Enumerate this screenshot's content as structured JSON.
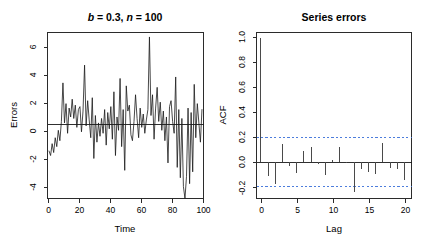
{
  "figure": {
    "width": 423,
    "height": 250,
    "background": "#ffffff",
    "line_color": "#1a1a1a",
    "conf_color": "#3a6fd8"
  },
  "panels": {
    "left": {
      "title_full": "b = 0.3, n = 100",
      "title_parts": {
        "b_sym": "b",
        "b_eq": " = 0.3, ",
        "n_sym": "n",
        "n_eq": " = 100"
      },
      "xlabel": "Time",
      "ylabel": "Errors",
      "xticks": [
        "0",
        "20",
        "40",
        "60",
        "80",
        "100"
      ],
      "yticks": [
        "6",
        "4",
        "2",
        "0",
        "-2",
        "-4"
      ]
    },
    "right": {
      "title": "Series errors",
      "xlabel": "Lag",
      "ylabel": "ACF",
      "xticks": [
        "0",
        "5",
        "10",
        "15",
        "20"
      ],
      "yticks": [
        "1.0",
        "0.8",
        "0.6",
        "0.4",
        "0.2",
        "0.0",
        "-0.2"
      ]
    }
  },
  "chart_data": [
    {
      "type": "line",
      "title": "b = 0.3, n = 100",
      "xlabel": "Time",
      "ylabel": "Errors",
      "xlim": [
        0,
        101
      ],
      "ylim": [
        -5.0,
        6.2
      ],
      "xticks": [
        0,
        20,
        40,
        60,
        80,
        100
      ],
      "yticks": [
        6,
        4,
        2,
        0,
        -2,
        -4
      ],
      "grid": false,
      "legend": "none",
      "zero_reference_line": 0,
      "x": [
        1,
        2,
        3,
        4,
        5,
        6,
        7,
        8,
        9,
        10,
        11,
        12,
        13,
        14,
        15,
        16,
        17,
        18,
        19,
        20,
        21,
        22,
        23,
        24,
        25,
        26,
        27,
        28,
        29,
        30,
        31,
        32,
        33,
        34,
        35,
        36,
        37,
        38,
        39,
        40,
        41,
        42,
        43,
        44,
        45,
        46,
        47,
        48,
        49,
        50,
        51,
        52,
        53,
        54,
        55,
        56,
        57,
        58,
        59,
        60,
        61,
        62,
        63,
        64,
        65,
        66,
        67,
        68,
        69,
        70,
        71,
        72,
        73,
        74,
        75,
        76,
        77,
        78,
        79,
        80,
        81,
        82,
        83,
        84,
        85,
        86,
        87,
        88,
        89,
        90,
        91,
        92,
        93,
        94,
        95,
        96,
        97,
        98,
        99,
        100
      ],
      "values": [
        -1.8,
        -2.1,
        -1.3,
        -1.9,
        -0.9,
        -1.5,
        -0.4,
        -1.1,
        0.2,
        2.8,
        0.1,
        1.4,
        -0.6,
        1.1,
        0.5,
        1.7,
        0.4,
        1.3,
        -0.2,
        1.0,
        1.2,
        -0.5,
        0.9,
        4.0,
        -0.1,
        1.6,
        0.3,
        -0.9,
        1.8,
        -2.3,
        0.6,
        -1.2,
        0.1,
        -0.8,
        0.4,
        -0.6,
        1.0,
        -1.4,
        0.8,
        -0.3,
        1.2,
        -1.0,
        2.2,
        -2.1,
        0.5,
        -0.4,
        3.1,
        -1.5,
        1.0,
        -3.1,
        2.6,
        0.9,
        1.3,
        -0.7,
        -1.1,
        0.2,
        2.0,
        0.4,
        -0.9,
        1.1,
        -0.2,
        0.7,
        -0.6,
        0.3,
        1.0,
        5.9,
        0.6,
        2.0,
        -1.0,
        1.1,
        2.5,
        0.2,
        1.5,
        -0.4,
        0.9,
        -1.1,
        0.5,
        -2.6,
        1.2,
        1.6,
        0.2,
        -0.6,
        3.2,
        -2.9,
        1.0,
        -3.6,
        0.4,
        -4.2,
        -5.0,
        -3.5,
        1.1,
        -4.0,
        0.8,
        -3.2,
        2.7,
        -0.9,
        1.4,
        0.1,
        -1.2,
        1.0
      ]
    },
    {
      "type": "bar",
      "title": "Series errors",
      "xlabel": "Lag",
      "ylabel": "ACF",
      "xlim": [
        -0.6,
        21
      ],
      "ylim": [
        -0.29,
        1.04
      ],
      "xticks": [
        0,
        5,
        10,
        15,
        20
      ],
      "yticks": [
        1.0,
        0.8,
        0.6,
        0.4,
        0.2,
        0.0,
        -0.2
      ],
      "grid": false,
      "legend": "none",
      "confidence_bounds": [
        0.196,
        -0.196
      ],
      "categories": [
        0,
        1,
        2,
        3,
        4,
        5,
        6,
        7,
        8,
        9,
        10,
        11,
        12,
        13,
        14,
        15,
        16,
        17,
        18,
        19,
        20
      ],
      "values": [
        1.0,
        -0.11,
        -0.17,
        0.145,
        -0.03,
        -0.085,
        0.09,
        0.125,
        -0.015,
        -0.105,
        0.02,
        0.125,
        -0.005,
        -0.235,
        -0.055,
        -0.075,
        -0.095,
        0.155,
        -0.045,
        -0.055,
        -0.14
      ]
    }
  ]
}
